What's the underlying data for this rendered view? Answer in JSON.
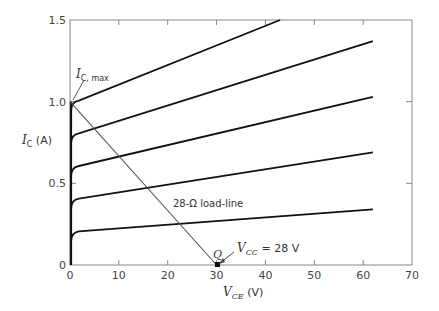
{
  "chart_data": {
    "type": "line",
    "title": "",
    "xlabel": "V_CE (V)",
    "ylabel": "I_C (A)",
    "xlim": [
      0,
      70
    ],
    "ylim": [
      0,
      1.5
    ],
    "xticks": [
      0,
      10,
      20,
      30,
      40,
      50,
      60,
      70
    ],
    "yticks": [
      0,
      0.5,
      1.0,
      1.5
    ],
    "xtick_labels": [
      "0",
      "10",
      "20",
      "30",
      "40",
      "50",
      "60",
      "70"
    ],
    "ytick_labels": [
      "0",
      "0.5",
      "1.0",
      "1.5"
    ],
    "grid": false,
    "series": [
      {
        "name": "I_B curve 1",
        "x": [
          0,
          1,
          62
        ],
        "y": [
          0,
          0.2,
          0.34
        ]
      },
      {
        "name": "I_B curve 2",
        "x": [
          0,
          1,
          62
        ],
        "y": [
          0,
          0.4,
          0.69
        ]
      },
      {
        "name": "I_B curve 3",
        "x": [
          0,
          1,
          62
        ],
        "y": [
          0,
          0.6,
          1.03
        ]
      },
      {
        "name": "I_B curve 4",
        "x": [
          0,
          1,
          62
        ],
        "y": [
          0,
          0.8,
          1.37
        ]
      },
      {
        "name": "I_B curve 5",
        "x": [
          0,
          1,
          43
        ],
        "y": [
          0,
          1.0,
          1.5
        ]
      },
      {
        "name": "28-Ω load-line",
        "x": [
          0,
          30
        ],
        "y": [
          1.0,
          0
        ]
      }
    ],
    "annotations": [
      {
        "text": "I_C, max",
        "x": 0,
        "y": 1.0
      },
      {
        "text": "28-Ω load-line",
        "x": 14,
        "y": 0.38
      },
      {
        "text": "Q",
        "x": 30,
        "y": 0
      },
      {
        "text": "V_CC = 28 V",
        "x": 30,
        "y": 0
      }
    ]
  },
  "labels": {
    "ic_sym": "I",
    "ic_sub": "C",
    "ic_unit": " (A)",
    "vce_sym": "V",
    "vce_sub": "CE",
    "vce_unit": " (V)",
    "icmax_sym": "I",
    "icmax_sub": "C, max",
    "loadline": "28-Ω load-line",
    "q": "Q",
    "vcc_sym": "V",
    "vcc_sub": "CC",
    "vcc_val": " = 28 V"
  }
}
